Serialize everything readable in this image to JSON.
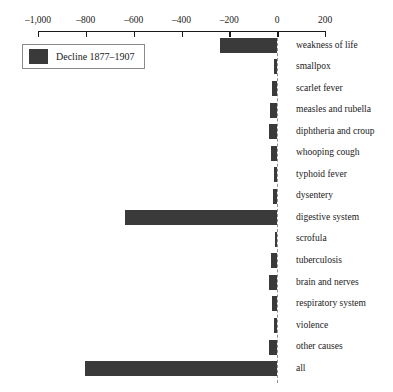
{
  "figure": {
    "cropped_title_sliver": "",
    "legend": {
      "label": "Decline 1877–1907",
      "swatch_color": "#3a3a3a"
    }
  },
  "chart_data": {
    "type": "bar",
    "orientation": "horizontal",
    "title": "",
    "xlabel": "",
    "ylabel": "",
    "xlim": [
      -1000,
      200
    ],
    "xticks": [
      -1000,
      -800,
      -600,
      -400,
      -200,
      0,
      200
    ],
    "xticklabels": [
      "–1,000",
      "–800",
      "–600",
      "–400",
      "–200",
      "0",
      "200"
    ],
    "grid": false,
    "legend_position": "upper-left",
    "series": [
      {
        "name": "Decline 1877–1907",
        "color": "#3a3a3a",
        "values": [
          -240,
          -12,
          -22,
          -30,
          -36,
          -24,
          -14,
          -16,
          -636,
          -10,
          -24,
          -34,
          -20,
          -12,
          -35,
          -805
        ]
      }
    ],
    "categories": [
      "weakness of life",
      "smallpox",
      "scarlet fever",
      "measles and rubella",
      "diphtheria and croup",
      "whooping cough",
      "typhoid fever",
      "dysentery",
      "digestive system",
      "scrofula",
      "tuberculosis",
      "brain and nerves",
      "respiratory system",
      "violence",
      "other causes",
      "all"
    ]
  }
}
